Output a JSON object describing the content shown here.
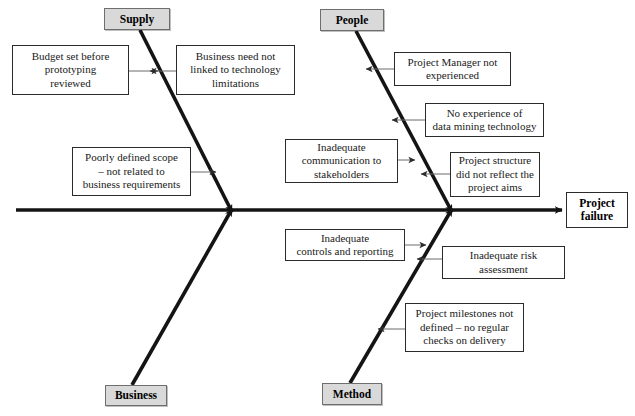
{
  "diagram": {
    "type": "fishbone-ishikawa",
    "effect": {
      "label": "Project\nfailure",
      "x": 566,
      "y": 192,
      "w": 62,
      "h": 36
    },
    "spine": {
      "start_x": 16,
      "end_x": 566,
      "y": 210,
      "color": "#141414"
    },
    "categories": [
      {
        "id": "supply",
        "label": "Supply",
        "position": "top-left",
        "box": {
          "x": 104,
          "y": 8,
          "w": 66,
          "h": 22
        },
        "bone": {
          "x1": 140,
          "y1": 30,
          "x2": 232,
          "y2": 212
        }
      },
      {
        "id": "people",
        "label": "People",
        "position": "top-right",
        "box": {
          "x": 320,
          "y": 9,
          "w": 64,
          "h": 22
        },
        "bone": {
          "x1": 356,
          "y1": 31,
          "x2": 452,
          "y2": 212
        }
      },
      {
        "id": "business",
        "label": "Business",
        "position": "bottom-left",
        "box": {
          "x": 105,
          "y": 385,
          "w": 62,
          "h": 21
        },
        "bone": {
          "x1": 132,
          "y1": 385,
          "x2": 232,
          "y2": 209
        }
      },
      {
        "id": "method",
        "label": "Method",
        "position": "bottom-right",
        "box": {
          "x": 322,
          "y": 383,
          "w": 60,
          "h": 22
        },
        "bone": {
          "x1": 350,
          "y1": 383,
          "x2": 452,
          "y2": 209
        }
      }
    ],
    "causes": [
      {
        "id": "budget-set-before-prototyping",
        "category": "supply",
        "text": "Budget set before\nprototyping\nreviewed",
        "box": {
          "x": 12,
          "y": 45,
          "w": 117,
          "h": 50
        },
        "connector": {
          "x1": 129,
          "y1": 71,
          "x2": 158,
          "y2": 71,
          "arrow": "right"
        }
      },
      {
        "id": "business-need-not-linked",
        "category": "supply",
        "text": "Business need not\nlinked to technology\nlimitations",
        "box": {
          "x": 176,
          "y": 45,
          "w": 119,
          "h": 50
        },
        "connector": {
          "x1": 176,
          "y1": 71,
          "x2": 150,
          "y2": 71,
          "arrow": "left"
        }
      },
      {
        "id": "poorly-defined-scope",
        "category": "supply",
        "text": "Poorly defined scope\n– not related to\nbusiness requirements",
        "box": {
          "x": 72,
          "y": 147,
          "w": 119,
          "h": 49
        },
        "connector": {
          "x1": 191,
          "y1": 172,
          "x2": 216,
          "y2": 172,
          "arrow": "right"
        }
      },
      {
        "id": "project-manager-not-experienced",
        "category": "people",
        "text": "Project Manager not\nexperienced",
        "box": {
          "x": 394,
          "y": 52,
          "w": 117,
          "h": 34
        },
        "connector": {
          "x1": 394,
          "y1": 69,
          "x2": 366,
          "y2": 69,
          "arrow": "left"
        }
      },
      {
        "id": "no-experience-data-mining",
        "category": "people",
        "text": "No experience of\ndata mining technology",
        "box": {
          "x": 425,
          "y": 103,
          "w": 119,
          "h": 34
        },
        "connector": {
          "x1": 425,
          "y1": 120,
          "x2": 392,
          "y2": 120,
          "arrow": "left"
        }
      },
      {
        "id": "inadequate-communication",
        "category": "people",
        "text": "Inadequate\ncommunication to\nstakeholders",
        "box": {
          "x": 285,
          "y": 139,
          "w": 113,
          "h": 44
        },
        "connector": {
          "x1": 398,
          "y1": 160,
          "x2": 415,
          "y2": 160,
          "arrow": "right"
        }
      },
      {
        "id": "project-structure-not-reflect-aims",
        "category": "people",
        "text": "Project structure\ndid not reflect the\nproject aims",
        "box": {
          "x": 450,
          "y": 152,
          "w": 90,
          "h": 45
        },
        "connector": {
          "x1": 450,
          "y1": 174,
          "x2": 421,
          "y2": 174,
          "arrow": "left"
        }
      },
      {
        "id": "inadequate-controls-reporting",
        "category": "method",
        "text": "Inadequate\ncontrols and reporting",
        "box": {
          "x": 285,
          "y": 229,
          "w": 120,
          "h": 32
        },
        "connector": {
          "x1": 405,
          "y1": 245,
          "x2": 426,
          "y2": 245,
          "arrow": "right"
        }
      },
      {
        "id": "inadequate-risk-assessment",
        "category": "method",
        "text": "Inadequate risk\nassessment",
        "box": {
          "x": 442,
          "y": 246,
          "w": 123,
          "h": 33
        },
        "connector": {
          "x1": 442,
          "y1": 259,
          "x2": 417,
          "y2": 259,
          "arrow": "left"
        }
      },
      {
        "id": "project-milestones-not-defined",
        "category": "method",
        "text": "Project milestones not\ndefined – no regular\nchecks on delivery",
        "box": {
          "x": 405,
          "y": 303,
          "w": 119,
          "h": 49
        },
        "connector": {
          "x1": 405,
          "y1": 329,
          "x2": 378,
          "y2": 329,
          "arrow": "left"
        }
      }
    ]
  },
  "colors": {
    "spine": "#141414",
    "bone": "#141414",
    "connector": "#6a6a6a",
    "box_border": "#2b2b2b",
    "category_fill": "#d9d9d9",
    "category_border": "#6e6e6e",
    "background": "#ffffff",
    "text": "#1a1a1a"
  }
}
